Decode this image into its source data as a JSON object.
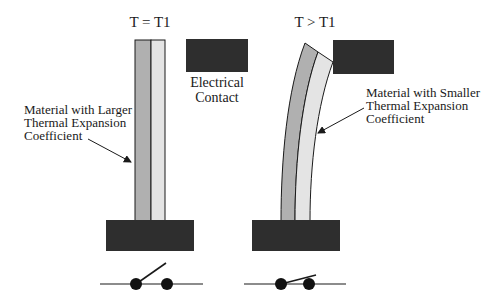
{
  "diagram": {
    "left_panel": {
      "title": "T = T1",
      "contact_label": [
        "Electrical",
        "Contact"
      ],
      "material_label": [
        "Material with Larger",
        "Thermal Expansion",
        "Coefficient"
      ],
      "switch_state": "open"
    },
    "right_panel": {
      "title": "T > T1",
      "material_label": [
        "Material with Smaller",
        "Thermal Expansion",
        "Coefficient"
      ],
      "switch_state": "closed"
    },
    "colors": {
      "dark_block": "#2e2e2e",
      "larger_expansion_material": "#b0b0b0",
      "smaller_expansion_material": "#e4e4e4",
      "outline": "#1a1a1a"
    }
  }
}
